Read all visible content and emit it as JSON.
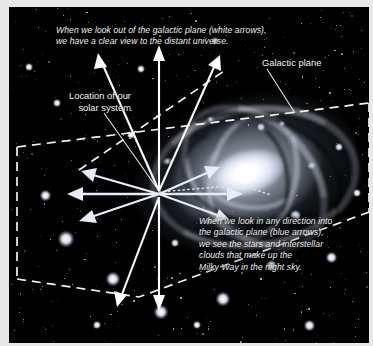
{
  "diagram": {
    "background_color": "#000000",
    "frame_color": "#e8e8e8",
    "captions": {
      "out_of_plane": "When we look out of the galactic plane (white arrows),\nwe have a clear view to the distant universe.",
      "into_plane": "When we look in any direction into\nthe galactic plane (blue arrows),\nwe see the stars and interstellar\nclouds that make up the\nMilky Way in the night sky."
    },
    "labels": {
      "solar_system": "Location of our\nsolar system",
      "galactic_plane": "Galactic plane"
    },
    "colors": {
      "white_arrows": "#ffffff",
      "blue_arrows": "#e6ecfa",
      "plane_dashes": "#f2f2f2",
      "caption_text": "#f0f0f0",
      "label_text": "#f4f4f4",
      "galaxy_core": "#ffffff"
    },
    "elements": {
      "galaxy_name": "spiral-galaxy",
      "plane_shape": "dashed-parallelogram",
      "arrow_hub": "solar-system-position"
    }
  }
}
